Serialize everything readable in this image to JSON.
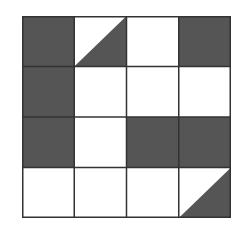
{
  "grid": {
    "rows": 4,
    "cols": 4,
    "fill_color": "#555555",
    "empty_color": "#ffffff",
    "line_color": "#333333",
    "cells": [
      [
        "full",
        "tri-lower-right",
        "empty",
        "full"
      ],
      [
        "full",
        "empty",
        "empty",
        "empty"
      ],
      [
        "full",
        "empty",
        "full",
        "full"
      ],
      [
        "empty",
        "empty",
        "empty",
        "tri-lower-right"
      ]
    ]
  }
}
